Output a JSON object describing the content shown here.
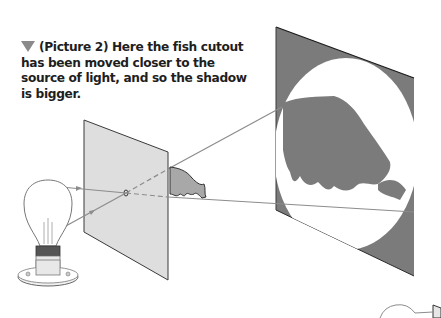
{
  "caption": {
    "marker": "down-triangle",
    "text": "(Picture 2) Here the fish cutout has been moved closer to the source of light, and so the shadow is bigger."
  },
  "diagram": {
    "elements": [
      "light-bulb",
      "cutout-card-with-pinhole",
      "fish-cutout",
      "shadow-screen",
      "fish-shadow",
      "light-rays"
    ],
    "colors": {
      "screen": "#7b7b7b",
      "card": "#dedede",
      "fish": "#a8a8a8",
      "ray": "#8c8c8c",
      "lit_area": "#ffffff"
    }
  }
}
